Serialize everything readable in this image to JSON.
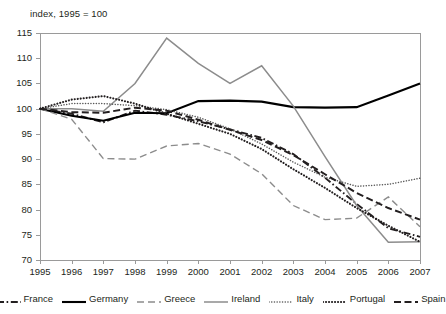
{
  "chart_data": {
    "type": "line",
    "title": "index, 1995 = 100",
    "xlabel": "",
    "ylabel": "index, 1995 = 100",
    "grid": false,
    "legend_position": "bottom",
    "xlim": [
      1995,
      2007
    ],
    "ylim": [
      70,
      115
    ],
    "ytick_step": 5,
    "x": [
      1995,
      1996,
      1997,
      1998,
      1999,
      2000,
      2001,
      2002,
      2003,
      2004,
      2005,
      2006,
      2007
    ],
    "categories": [
      "1995",
      "1996",
      "1997",
      "1998",
      "1999",
      "2000",
      "2001",
      "2002",
      "2003",
      "2004",
      "2005",
      "2006",
      "2007"
    ],
    "yticks": [
      "70",
      "75",
      "80",
      "85",
      "90",
      "95",
      "100",
      "105",
      "110",
      "115"
    ],
    "series": [
      {
        "name": "France",
        "style": "dash-dot",
        "color": "#231f20",
        "values": [
          100.0,
          99.0,
          97.3,
          99.6,
          98.8,
          97.5,
          95.9,
          94.2,
          91.0,
          86.3,
          81.1,
          76.3,
          74.6
        ]
      },
      {
        "name": "Germany",
        "style": "solid-bold",
        "color": "#000000",
        "values": [
          100.0,
          98.6,
          97.6,
          99.2,
          99.1,
          101.5,
          101.6,
          101.4,
          100.3,
          100.2,
          100.3,
          102.6,
          105.0
        ]
      },
      {
        "name": "Greece",
        "style": "dashed",
        "color": "#8c8c8c",
        "values": [
          100.0,
          97.9,
          90.1,
          90.0,
          92.6,
          93.1,
          91.0,
          87.1,
          80.8,
          78.0,
          78.3,
          82.5,
          76.6
        ]
      },
      {
        "name": "Ireland",
        "style": "solid",
        "color": "#8c8c8c",
        "values": [
          100.0,
          100.0,
          99.5,
          105.0,
          114.0,
          109.0,
          105.0,
          108.5,
          100.5,
          90.5,
          80.8,
          73.5,
          73.6
        ]
      },
      {
        "name": "Italy",
        "style": "dotted-fine",
        "color": "#595959",
        "values": [
          100.0,
          101.0,
          101.0,
          100.6,
          99.8,
          98.3,
          96.0,
          93.0,
          89.4,
          86.4,
          84.6,
          85.0,
          86.2
        ]
      },
      {
        "name": "Portugal",
        "style": "dotted-bold",
        "color": "#231f20",
        "values": [
          100.0,
          101.8,
          102.5,
          101.0,
          99.0,
          97.0,
          95.0,
          92.0,
          88.0,
          84.3,
          80.3,
          76.8,
          73.6
        ]
      },
      {
        "name": "Spain",
        "style": "dashed-bold",
        "color": "#231f20",
        "values": [
          100.0,
          99.3,
          99.2,
          100.2,
          99.6,
          97.8,
          95.8,
          93.8,
          90.8,
          87.0,
          83.3,
          80.3,
          78.0
        ]
      }
    ]
  }
}
